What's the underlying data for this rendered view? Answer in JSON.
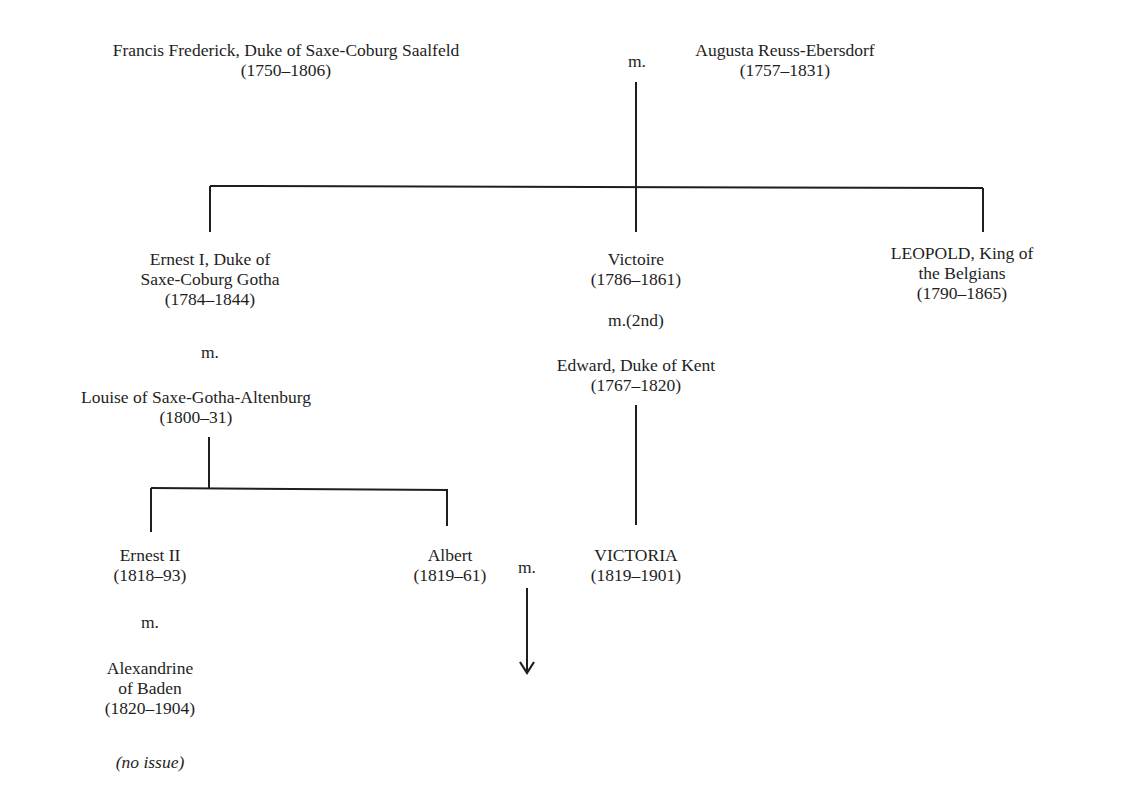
{
  "diagram": {
    "type": "family-tree",
    "title": "",
    "nodes": {
      "francis": {
        "lines": [
          "Francis Frederick, Duke of Saxe-Coburg Saalfeld",
          "(1750–1806)"
        ]
      },
      "augusta": {
        "lines": [
          "Augusta Reuss-Ebersdorf",
          "(1757–1831)"
        ]
      },
      "ernest1": {
        "lines": [
          "Ernest I, Duke of",
          "Saxe-Coburg Gotha",
          "(1784–1844)"
        ]
      },
      "louise": {
        "lines": [
          "Louise of Saxe-Gotha-Altenburg",
          "(1800–31)"
        ]
      },
      "victoire": {
        "lines": [
          "Victoire",
          "(1786–1861)"
        ]
      },
      "edward": {
        "lines": [
          "Edward, Duke of Kent",
          "(1767–1820)"
        ]
      },
      "leopold": {
        "lines": [
          "LEOPOLD, King of",
          "the Belgians",
          "(1790–1865)"
        ]
      },
      "ernest2": {
        "lines": [
          "Ernest II",
          "(1818–93)"
        ]
      },
      "alexandrine": {
        "lines": [
          "Alexandrine",
          "of Baden",
          "(1820–1904)"
        ]
      },
      "albert": {
        "lines": [
          "Albert",
          "(1819–61)"
        ]
      },
      "victoria": {
        "lines": [
          "VICTORIA",
          "(1819–1901)"
        ]
      }
    },
    "marriage_labels": {
      "francis_augusta": "m.",
      "ernest1_louise": "m.",
      "victoire_edward": "m.(2nd)",
      "ernest2_alexandrine": "m.",
      "albert_victoria": "m."
    },
    "notes": {
      "ernest2_no_issue": "(no issue)"
    },
    "edges": [
      {
        "from": "francis+augusta",
        "to": [
          "ernest1",
          "victoire",
          "leopold"
        ]
      },
      {
        "from": "ernest1+louise",
        "to": [
          "ernest2",
          "albert"
        ]
      },
      {
        "from": "victoire+edward",
        "to": [
          "victoria"
        ]
      },
      {
        "from": "albert+victoria",
        "to": [
          "descendants (arrow)"
        ]
      }
    ],
    "line_color": "#1e1e1e"
  }
}
